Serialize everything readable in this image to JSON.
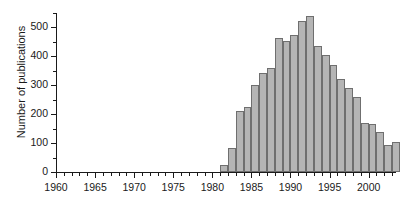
{
  "chart_data": {
    "type": "bar",
    "title": "",
    "xlabel": "",
    "ylabel": "Number of publications",
    "xlim": [
      1960,
      2003.5
    ],
    "ylim": [
      0,
      550
    ],
    "yticks": [
      0,
      100,
      200,
      300,
      400,
      500
    ],
    "ytick_labels": [
      "0",
      "100",
      "200",
      "300",
      "400",
      "500"
    ],
    "xticks": [
      1960,
      1965,
      1970,
      1975,
      1980,
      1985,
      1990,
      1995,
      2000
    ],
    "xtick_labels": [
      "1960",
      "1965",
      "1970",
      "1975",
      "1980",
      "1985",
      "1990",
      "1995",
      "2000"
    ],
    "minor_xtick_interval": 1,
    "grid": false,
    "legend": null,
    "bar_color": "#b5b5b5",
    "bar_edge_color": "#6f6f6f",
    "axis_color": "#1a1a1a",
    "categories": [
      1960,
      1961,
      1962,
      1963,
      1964,
      1965,
      1966,
      1967,
      1968,
      1969,
      1970,
      1971,
      1972,
      1973,
      1974,
      1975,
      1976,
      1977,
      1978,
      1979,
      1980,
      1981,
      1982,
      1983,
      1984,
      1985,
      1986,
      1987,
      1988,
      1989,
      1990,
      1991,
      1992,
      1993,
      1994,
      1995,
      1996,
      1997,
      1998,
      1999,
      2000,
      2001,
      2002,
      2003
    ],
    "values": [
      0,
      0,
      0,
      0,
      0,
      0,
      0,
      0,
      0,
      0,
      0,
      0,
      0,
      0,
      0,
      0,
      0,
      0,
      0,
      0,
      0,
      25,
      82,
      212,
      225,
      301,
      343,
      361,
      463,
      454,
      475,
      522,
      540,
      436,
      406,
      369,
      321,
      289,
      261,
      171,
      166,
      139,
      92,
      105
    ]
  }
}
